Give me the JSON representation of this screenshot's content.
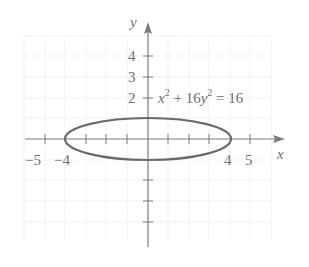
{
  "diagram": {
    "equation": {
      "lhs_x": "x",
      "exp1": "2",
      "plus": " + 16",
      "lhs_y": "y",
      "exp2": "2",
      "rhs": " = 16",
      "full": "x^2 + 16y^2 = 16"
    },
    "axes": {
      "x_label": "x",
      "y_label": "y"
    },
    "x_tick_labels": [
      {
        "value": "−5",
        "pos": -5
      },
      {
        "value": "−4",
        "pos": -4
      },
      {
        "value": "4",
        "pos": 4
      },
      {
        "value": "5",
        "pos": 5
      }
    ],
    "y_tick_labels": [
      {
        "value": "4",
        "pos": 4
      },
      {
        "value": "3",
        "pos": 3
      },
      {
        "value": "2",
        "pos": 2
      }
    ],
    "curve": {
      "type": "ellipse",
      "center": [
        0,
        0
      ],
      "semi_major_x": 4,
      "semi_minor_y": 1,
      "color": "#6a6a6a"
    },
    "colors": {
      "axis": "#7a7a7a",
      "text": "#6e6e6e",
      "grid": "#f1f1f1"
    }
  }
}
